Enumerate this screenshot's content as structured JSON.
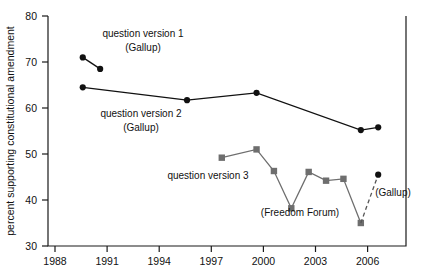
{
  "chart_data": {
    "type": "line",
    "title": "",
    "xlabel": "",
    "ylabel": "percent supporting constitutional amendment",
    "xlim": [
      1987.0,
      2007.6
    ],
    "ylim": [
      30,
      80
    ],
    "xticks": [
      1988,
      1991,
      1994,
      1997,
      2000,
      2003,
      2006
    ],
    "yticks": [
      30,
      40,
      50,
      60,
      70,
      80
    ],
    "grid": false,
    "legend_position": "inline-annotations",
    "series": [
      {
        "name": "question version 1 (Gallup)",
        "marker": "circle",
        "color": "#111111",
        "linestyle": "solid",
        "x": [
          1989,
          1990
        ],
        "values": [
          71.0,
          68.5
        ]
      },
      {
        "name": "question version 2 (Gallup)",
        "marker": "circle",
        "color": "#111111",
        "linestyle": "solid",
        "x": [
          1989,
          1995,
          1999,
          2005,
          2006
        ],
        "values": [
          64.5,
          61.7,
          63.3,
          55.2,
          55.8
        ]
      },
      {
        "name": "question version 3 (Freedom Forum)",
        "marker": "square",
        "color": "#6e6e6e",
        "linestyle": "solid",
        "x": [
          1997,
          1999,
          2000,
          2001,
          2002,
          2003,
          2004,
          2005
        ],
        "values": [
          49.2,
          51.0,
          46.3,
          38.2,
          46.1,
          44.2,
          44.6,
          35.0
        ]
      },
      {
        "name": "(Gallup)",
        "marker": "circle",
        "color": "#111111",
        "linestyle": "dashed",
        "x": [
          2005,
          2006
        ],
        "values": [
          35.0,
          45.5
        ]
      }
    ],
    "annotations": [
      {
        "text": "question version 1",
        "x": 1991.6,
        "y": 75.8
      },
      {
        "text": "(Gallup)",
        "x": 1992.0,
        "y": 72.6
      },
      {
        "text": "question version 2",
        "x": 1991.5,
        "y": 58.6
      },
      {
        "text": "(Gallup)",
        "x": 1992.0,
        "y": 55.4
      },
      {
        "text": "question version 3",
        "x": 1997.8,
        "y": 44.9
      },
      {
        "text": "(Freedom Forum)",
        "x": 2002.0,
        "y": 35.1
      },
      {
        "text": "(Gallup)",
        "x": 2006.3,
        "y": 42.2
      }
    ]
  },
  "axis": {
    "ylabel": "percent supporting constitutional amendment",
    "yticklabels": [
      "80",
      "70",
      "60",
      "50",
      "40",
      "30"
    ],
    "xticklabels": [
      "1988",
      "1991",
      "1994",
      "1997",
      "2000",
      "2003",
      "2006"
    ]
  },
  "labels": {
    "qv1": "question version 1",
    "qv1_src": "(Gallup)",
    "qv2": "question version 2",
    "qv2_src": "(Gallup)",
    "qv3": "question version 3",
    "qv3_src": "(Freedom Forum)",
    "qv4_src": "(Gallup)"
  }
}
